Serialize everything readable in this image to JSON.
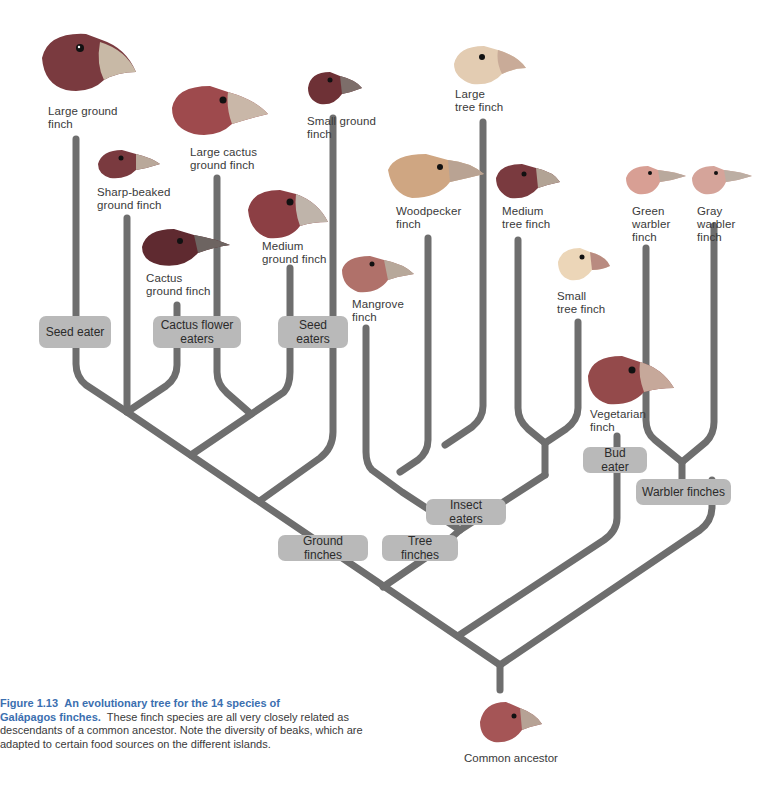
{
  "figure": {
    "number": "Figure 1.13",
    "title": "An evolutionary tree for the 14 species of Galápagos finches.",
    "title_line1": "An evolutionary tree for the 14 species of",
    "title_line2": "Galápagos finches.",
    "body": "These finch species are all very closely related as descendants of a common ancestor. Note the diversity of beaks, which are adapted to certain food sources on the different islands.",
    "body_line1": "These finch species are all very closely related as",
    "body_line2": "descendants of a common ancestor. Note the diversity of beaks, which are",
    "body_line3": "adapted to certain food sources on the different islands."
  },
  "colors": {
    "branch": "#6e6e6e",
    "group_box": "#b9b9b9",
    "caption_accent": "#3b6fb0",
    "text": "#3a3a3a"
  },
  "species": [
    {
      "id": "large-ground-finch",
      "line1": "Large ground",
      "line2": "finch",
      "group": "Ground finches"
    },
    {
      "id": "sharp-beaked-ground-finch",
      "line1": "Sharp-beaked",
      "line2": "ground finch",
      "group": "Ground finches"
    },
    {
      "id": "cactus-ground-finch",
      "line1": "Cactus",
      "line2": "ground finch",
      "group": "Ground finches"
    },
    {
      "id": "large-cactus-ground-finch",
      "line1": "Large cactus",
      "line2": "ground finch",
      "group": "Ground finches"
    },
    {
      "id": "medium-ground-finch",
      "line1": "Medium",
      "line2": "ground finch",
      "group": "Ground finches"
    },
    {
      "id": "small-ground-finch",
      "line1": "Small ground",
      "line2": "finch",
      "group": "Ground finches"
    },
    {
      "id": "mangrove-finch",
      "line1": "Mangrove",
      "line2": "finch",
      "group": "Tree finches"
    },
    {
      "id": "woodpecker-finch",
      "line1": "Woodpecker",
      "line2": "finch",
      "group": "Tree finches"
    },
    {
      "id": "large-tree-finch",
      "line1": "Large",
      "line2": "tree finch",
      "group": "Tree finches"
    },
    {
      "id": "medium-tree-finch",
      "line1": "Medium",
      "line2": "tree finch",
      "group": "Tree finches"
    },
    {
      "id": "small-tree-finch",
      "line1": "Small",
      "line2": "tree finch",
      "group": "Tree finches"
    },
    {
      "id": "vegetarian-finch",
      "line1": "Vegetarian",
      "line2": "finch",
      "group": "Tree finches"
    },
    {
      "id": "green-warbler-finch",
      "line1": "Green",
      "line2": "warbler",
      "line3": "finch",
      "group": "Warbler finches"
    },
    {
      "id": "gray-warbler-finch",
      "line1": "Gray",
      "line2": "warbler",
      "line3": "finch",
      "group": "Warbler finches"
    }
  ],
  "group_labels": {
    "seed_eater": "Seed eater",
    "cactus_flower_line1": "Cactus flower",
    "cactus_flower_line2": "eaters",
    "seed_eaters": "Seed eaters",
    "insect_eaters": "Insect eaters",
    "bud_eater": "Bud eater",
    "ground_finches": "Ground finches",
    "tree_finches": "Tree finches",
    "warbler_finches": "Warbler finches"
  },
  "root": {
    "label": "Common ancestor"
  }
}
